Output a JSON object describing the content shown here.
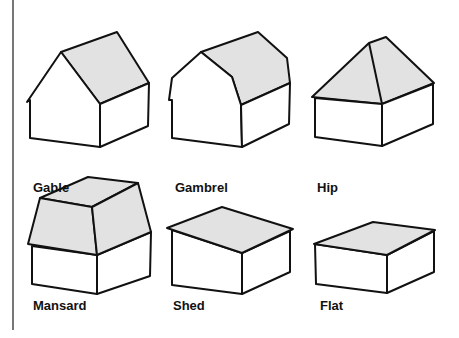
{
  "colors": {
    "roof_fill": "#e2e2e2",
    "wall_fill": "#ffffff",
    "stroke": "#111111",
    "rule": "#777777"
  },
  "roofs": [
    {
      "name": "gable",
      "label": "Gable"
    },
    {
      "name": "gambrel",
      "label": "Gambrel"
    },
    {
      "name": "hip",
      "label": "Hip"
    },
    {
      "name": "mansard",
      "label": "Mansard"
    },
    {
      "name": "shed",
      "label": "Shed"
    },
    {
      "name": "flat",
      "label": "Flat"
    }
  ]
}
